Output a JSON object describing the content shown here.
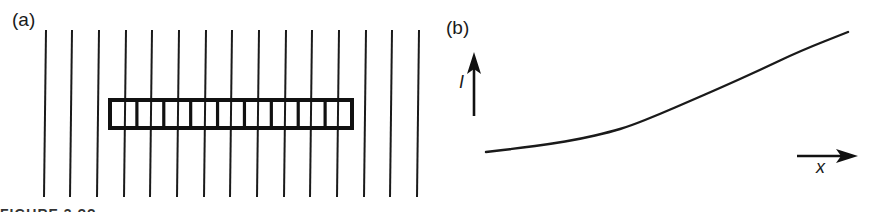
{
  "figure": {
    "panel_a": {
      "label": "(a)",
      "field_lines": {
        "count": 15,
        "top_x": [
          46,
          72,
          99,
          126,
          152,
          179,
          206,
          232,
          259,
          286,
          312,
          339,
          366,
          392,
          419
        ],
        "top_y": 30,
        "bottom_y": 197,
        "tilt_px": -2,
        "color": "#1a1a1a"
      },
      "bar": {
        "x": 110,
        "y": 100,
        "width": 242,
        "height": 28,
        "cells": 9,
        "color": "#111111"
      }
    },
    "panel_b": {
      "label": "(b)",
      "y_axis_label": "I",
      "x_axis_label": "x",
      "curve_color": "#1a1a1a"
    },
    "caption": {
      "text": "FIGURE 3.??"
    }
  },
  "chart_data": {
    "type": "line",
    "title": "(b)",
    "xlabel": "x",
    "ylabel": "I",
    "x": [
      486,
      520,
      550,
      580,
      610,
      630,
      660,
      690,
      720,
      760,
      800,
      848
    ],
    "values": [
      152,
      148,
      144,
      139,
      132,
      126,
      114,
      101,
      88,
      70,
      51,
      32
    ],
    "grid": false,
    "legend": null,
    "note": "Values are pixel coordinates of a qualitative monotonically increasing curve (y in screen pixels, smaller = higher); no numeric ticks shown."
  }
}
